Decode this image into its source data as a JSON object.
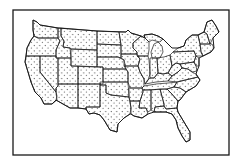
{
  "map": {
    "subject": "Contiguous United States",
    "style": "stippled black dots on white, state boundaries outlined",
    "colors": {
      "background": "#ffffff",
      "ink": "#1a1a1a"
    },
    "frame": {
      "x": 13,
      "y": 10,
      "width": 216,
      "height": 145
    },
    "labels": []
  }
}
